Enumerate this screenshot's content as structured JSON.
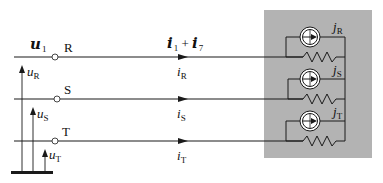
{
  "diagram": {
    "title_voltage": {
      "symbol": "u",
      "index": "1"
    },
    "title_current": {
      "symbol_a": "i",
      "index_a": "1",
      "op": "+",
      "symbol_b": "i",
      "index_b": "7"
    },
    "phases": [
      {
        "name": "R",
        "voltage": "u",
        "voltage_sub": "R",
        "current": "i",
        "current_sub": "R",
        "source": "j",
        "source_sub": "R"
      },
      {
        "name": "S",
        "voltage": "u",
        "voltage_sub": "S",
        "current": "i",
        "current_sub": "S",
        "source": "j",
        "source_sub": "S"
      },
      {
        "name": "T",
        "voltage": "u",
        "voltage_sub": "T",
        "current": "i",
        "current_sub": "T",
        "source": "j",
        "source_sub": "T"
      }
    ],
    "colors": {
      "load_box": "#b3b3b3",
      "line": "#1a1a1a",
      "source_fill": "#ffffff"
    },
    "icons": [
      "current-source-icon",
      "resistor-icon",
      "node-terminal-icon",
      "ground-bar-icon",
      "arrow-icon"
    ]
  }
}
